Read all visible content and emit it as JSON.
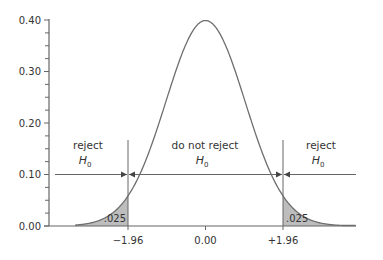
{
  "chart_data": {
    "type": "area",
    "title": "",
    "xlabel": "",
    "ylabel": "",
    "ylim": [
      0.0,
      0.4
    ],
    "xlim": [
      -3.3,
      3.8
    ],
    "grid": false,
    "y_ticks": [
      "0.00",
      "0.10",
      "0.20",
      "0.30",
      "0.40"
    ],
    "y_tick_values": [
      0.0,
      0.1,
      0.2,
      0.3,
      0.4
    ],
    "y_minor_ticks_per_major": 4,
    "x_ticks": [
      "−1.96",
      "0.00",
      "+1.96"
    ],
    "x_tick_values": [
      -1.96,
      0.0,
      1.96
    ],
    "curve": {
      "distribution": "normal",
      "mean": 0,
      "sd": 1,
      "peak_density": 0.399
    },
    "shaded_regions": [
      {
        "from": -3.3,
        "to": -1.96,
        "area_label": ".025",
        "fill": "#bdbdbd"
      },
      {
        "from": 1.96,
        "to": 3.8,
        "area_label": ".025",
        "fill": "#bdbdbd"
      }
    ],
    "critical_lines": [
      -1.96,
      1.96
    ],
    "annotations": [
      {
        "text": "reject",
        "sub": "H",
        "subscript": "0",
        "region": "left"
      },
      {
        "text": "do not reject",
        "sub": "H",
        "subscript": "0",
        "region": "middle"
      },
      {
        "text": "reject",
        "sub": "H",
        "subscript": "0",
        "region": "right"
      }
    ],
    "arrow_level": 0.1,
    "colors": {
      "curve": "#6e6e6e",
      "axis": "#666666",
      "shade": "#bdbdbd",
      "text": "#333333"
    }
  }
}
